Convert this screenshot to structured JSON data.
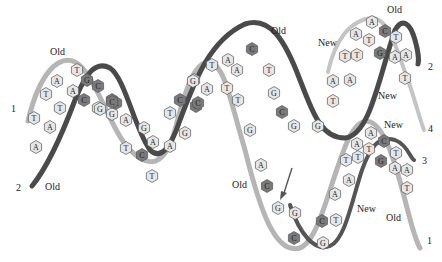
{
  "diagram": {
    "colors": {
      "old_strand_light": "#b5b5b5",
      "old_strand_dark": "#4a4a4a",
      "new_strand_light": "#c4c4c4",
      "new_strand_dark": "#555555",
      "hex_light": "#e6e6e6",
      "hex_dark": "#7a7a7a",
      "arrow": "#555555"
    },
    "labels": [
      {
        "id": "old-top-left",
        "text": "Old",
        "x": 50,
        "y": 55
      },
      {
        "id": "old-bottom-left",
        "text": "Old",
        "x": 45,
        "y": 190
      },
      {
        "id": "old-top-mid",
        "text": "Old",
        "x": 271,
        "y": 34
      },
      {
        "id": "new-top-right",
        "text": "New",
        "x": 318,
        "y": 46
      },
      {
        "id": "old-top-right",
        "text": "Old",
        "x": 387,
        "y": 13
      },
      {
        "id": "new-right-mid",
        "text": "New",
        "x": 378,
        "y": 99
      },
      {
        "id": "new-right-upper4",
        "text": "New",
        "x": 384,
        "y": 128
      },
      {
        "id": "old-lower-mid",
        "text": "Old",
        "x": 232,
        "y": 188
      },
      {
        "id": "new-lower-right",
        "text": "New",
        "x": 357,
        "y": 212
      },
      {
        "id": "old-lower-right",
        "text": "Old",
        "x": 386,
        "y": 221
      }
    ],
    "strand_numbers": [
      {
        "id": "strand-1-left",
        "text": "1",
        "x": 11,
        "y": 112
      },
      {
        "id": "strand-2-left",
        "text": "2",
        "x": 16,
        "y": 191
      },
      {
        "id": "strand-2-right",
        "text": "2",
        "x": 428,
        "y": 70
      },
      {
        "id": "strand-4-right",
        "text": "4",
        "x": 428,
        "y": 132
      },
      {
        "id": "strand-3-right",
        "text": "3",
        "x": 422,
        "y": 164
      },
      {
        "id": "strand-1-right",
        "text": "1",
        "x": 427,
        "y": 244
      }
    ],
    "bases": [
      {
        "b": "T",
        "x": 77,
        "y": 70,
        "d": false
      },
      {
        "b": "A",
        "x": 57,
        "y": 81,
        "d": false
      },
      {
        "b": "T",
        "x": 46,
        "y": 94,
        "d": false
      },
      {
        "b": "A",
        "x": 73,
        "y": 91,
        "d": false
      },
      {
        "b": "G",
        "x": 87,
        "y": 80,
        "d": true
      },
      {
        "b": "C",
        "x": 84,
        "y": 100,
        "d": true
      },
      {
        "b": "T",
        "x": 60,
        "y": 108,
        "d": false
      },
      {
        "b": "C",
        "x": 98,
        "y": 86,
        "d": true
      },
      {
        "b": "G",
        "x": 98,
        "y": 108,
        "d": false
      },
      {
        "b": "C",
        "x": 112,
        "y": 100,
        "d": true
      },
      {
        "b": "T",
        "x": 34,
        "y": 118,
        "d": false
      },
      {
        "b": "A",
        "x": 50,
        "y": 127,
        "d": false
      },
      {
        "b": "A",
        "x": 36,
        "y": 147,
        "d": false
      },
      {
        "b": "G",
        "x": 112,
        "y": 114,
        "d": false
      },
      {
        "b": "C",
        "x": 116,
        "y": 103,
        "d": true
      },
      {
        "b": "G",
        "x": 100,
        "y": 109,
        "d": false
      },
      {
        "b": "C",
        "x": 112,
        "y": 102,
        "d": true
      },
      {
        "b": "A",
        "x": 126,
        "y": 120,
        "d": false
      },
      {
        "b": "T",
        "x": 126,
        "y": 148,
        "d": false
      },
      {
        "b": "G",
        "x": 144,
        "y": 128,
        "d": false
      },
      {
        "b": "C",
        "x": 142,
        "y": 155,
        "d": true
      },
      {
        "b": "A",
        "x": 153,
        "y": 142,
        "d": false
      },
      {
        "b": "T",
        "x": 152,
        "y": 176,
        "d": false
      },
      {
        "b": "T",
        "x": 170,
        "y": 113,
        "d": false
      },
      {
        "b": "A",
        "x": 170,
        "y": 146,
        "d": false
      },
      {
        "b": "G",
        "x": 185,
        "y": 133,
        "d": false
      },
      {
        "b": "C",
        "x": 180,
        "y": 100,
        "d": true
      },
      {
        "b": "C",
        "x": 196,
        "y": 106,
        "d": true
      },
      {
        "b": "G",
        "x": 194,
        "y": 80,
        "d": false
      },
      {
        "b": "A",
        "x": 207,
        "y": 89,
        "d": false
      },
      {
        "b": "T",
        "x": 212,
        "y": 65,
        "d": false
      },
      {
        "b": "C",
        "x": 198,
        "y": 103,
        "d": true
      },
      {
        "b": "G",
        "x": 193,
        "y": 81,
        "d": false
      },
      {
        "b": "A",
        "x": 228,
        "y": 60,
        "d": false
      },
      {
        "b": "A",
        "x": 237,
        "y": 70,
        "d": false
      },
      {
        "b": "T",
        "x": 227,
        "y": 88,
        "d": false
      },
      {
        "b": "T",
        "x": 238,
        "y": 100,
        "d": false
      },
      {
        "b": "C",
        "x": 252,
        "y": 49,
        "d": true
      },
      {
        "b": "T",
        "x": 269,
        "y": 70,
        "d": false
      },
      {
        "b": "G",
        "x": 274,
        "y": 93,
        "d": false
      },
      {
        "b": "C",
        "x": 282,
        "y": 112,
        "d": true
      },
      {
        "b": "G",
        "x": 294,
        "y": 126,
        "d": false
      },
      {
        "b": "G",
        "x": 318,
        "y": 126,
        "d": false
      },
      {
        "b": "G",
        "x": 250,
        "y": 130,
        "d": false
      },
      {
        "b": "A",
        "x": 261,
        "y": 165,
        "d": false
      },
      {
        "b": "C",
        "x": 267,
        "y": 186,
        "d": true
      },
      {
        "b": "G",
        "x": 278,
        "y": 208,
        "d": false
      },
      {
        "b": "G",
        "x": 295,
        "y": 213,
        "d": false
      },
      {
        "b": "C",
        "x": 294,
        "y": 238,
        "d": true
      },
      {
        "b": "C",
        "x": 322,
        "y": 221,
        "d": true
      },
      {
        "b": "G",
        "x": 323,
        "y": 243,
        "d": false
      },
      {
        "b": "T",
        "x": 336,
        "y": 220,
        "d": false
      },
      {
        "b": "A",
        "x": 335,
        "y": 194,
        "d": false
      },
      {
        "b": "A",
        "x": 349,
        "y": 180,
        "d": false
      },
      {
        "b": "T",
        "x": 346,
        "y": 160,
        "d": false
      },
      {
        "b": "T",
        "x": 358,
        "y": 157,
        "d": false
      },
      {
        "b": "A",
        "x": 357,
        "y": 144,
        "d": false
      },
      {
        "b": "T",
        "x": 369,
        "y": 149,
        "d": false
      },
      {
        "b": "A",
        "x": 371,
        "y": 133,
        "d": false
      },
      {
        "b": "C",
        "x": 384,
        "y": 141,
        "d": true
      },
      {
        "b": "G",
        "x": 381,
        "y": 161,
        "d": true
      },
      {
        "b": "T",
        "x": 396,
        "y": 153,
        "d": false
      },
      {
        "b": "A",
        "x": 395,
        "y": 168,
        "d": false
      },
      {
        "b": "A",
        "x": 407,
        "y": 170,
        "d": false
      },
      {
        "b": "T",
        "x": 407,
        "y": 188,
        "d": false
      },
      {
        "b": "T",
        "x": 333,
        "y": 101,
        "d": false
      },
      {
        "b": "A",
        "x": 333,
        "y": 81,
        "d": false
      },
      {
        "b": "A",
        "x": 350,
        "y": 80,
        "d": false
      },
      {
        "b": "T",
        "x": 345,
        "y": 56,
        "d": false
      },
      {
        "b": "T",
        "x": 357,
        "y": 55,
        "d": false
      },
      {
        "b": "A",
        "x": 356,
        "y": 34,
        "d": false
      },
      {
        "b": "A",
        "x": 372,
        "y": 22,
        "d": false
      },
      {
        "b": "T",
        "x": 369,
        "y": 40,
        "d": false
      },
      {
        "b": "C",
        "x": 385,
        "y": 31,
        "d": true
      },
      {
        "b": "G",
        "x": 380,
        "y": 53,
        "d": true
      },
      {
        "b": "T",
        "x": 396,
        "y": 37,
        "d": false
      },
      {
        "b": "A",
        "x": 395,
        "y": 57,
        "d": false
      },
      {
        "b": "A",
        "x": 406,
        "y": 55,
        "d": false
      },
      {
        "b": "T",
        "x": 405,
        "y": 78,
        "d": false
      }
    ]
  }
}
